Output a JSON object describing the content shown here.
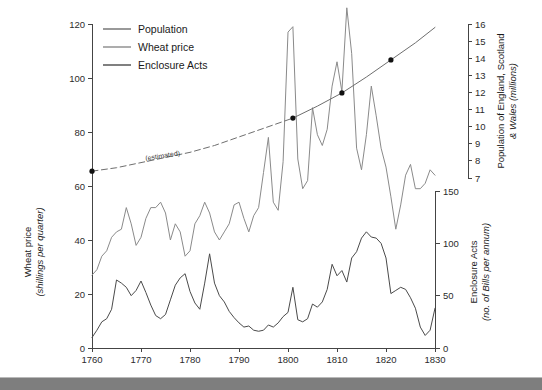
{
  "figure": {
    "background_color": "#ffffff",
    "bottom_bar_color": "#7e7e7e"
  },
  "legend": {
    "position": "top-left-inside",
    "entries": [
      {
        "label": "Population",
        "color": "#6e6e6e"
      },
      {
        "label": "Wheat price",
        "color": "#8a8a8a"
      },
      {
        "label": "Enclosure Acts",
        "color": "#4a4a4a"
      }
    ]
  },
  "annotations": [
    {
      "text": "(estimated)",
      "x_year": 1785,
      "y_value": 72
    }
  ],
  "axes": {
    "x": {
      "label": "",
      "ticks": [
        1760,
        1770,
        1780,
        1790,
        1800,
        1810,
        1820,
        1830
      ],
      "tick_labels": [
        "1760",
        "1770",
        "1780",
        "1790",
        "1800",
        "1810",
        "1820",
        "1830"
      ],
      "range": [
        1760,
        1830
      ]
    },
    "y_left": {
      "title_line1": "Wheat price",
      "title_line2": "(shillings per quarter)",
      "ticks": [
        0,
        20,
        40,
        60,
        80,
        100,
        120
      ],
      "tick_labels": [
        "0",
        "20",
        "40",
        "60",
        "80",
        "100",
        "120"
      ],
      "range": [
        0,
        120
      ]
    },
    "y_right_upper": {
      "title_line1": "Population of England, Scotland",
      "title_line2": "& Wales (millions)",
      "ticks": [
        7,
        8,
        9,
        10,
        11,
        12,
        13,
        14,
        15,
        16
      ],
      "tick_labels": [
        "7",
        "8",
        "9",
        "10",
        "11",
        "12",
        "13",
        "14",
        "15",
        "16"
      ],
      "range": [
        7,
        16
      ]
    },
    "y_right_lower": {
      "title_line1": "Enclosure Acts",
      "title_line2": "(no. of Bills per annum)",
      "ticks": [
        0,
        50,
        100,
        150
      ],
      "tick_labels": [
        "0",
        "50",
        "100",
        "150"
      ],
      "range": [
        0,
        150
      ]
    }
  },
  "chart_data": {
    "type": "line",
    "title": "",
    "xlabel": "",
    "ylabel": "Wheat price (shillings per quarter)",
    "xlim": [
      1760,
      1830
    ],
    "ylim": [
      0,
      120
    ],
    "grid": false,
    "legend_position": "upper left",
    "series": [
      {
        "name": "Population",
        "axis": "y_right_upper",
        "units": "millions",
        "color": "#6e6e6e",
        "style_segments": [
          {
            "from_year": 1760,
            "to_year": 1801,
            "dash": "dashed",
            "note": "(estimated)"
          },
          {
            "from_year": 1801,
            "to_year": 1830,
            "dash": "solid",
            "note": "census based"
          }
        ],
        "census_points": [
          {
            "x": 1760,
            "y": 7.4
          },
          {
            "x": 1801,
            "y": 10.5
          },
          {
            "x": 1811,
            "y": 11.97
          },
          {
            "x": 1821,
            "y": 13.9
          }
        ],
        "x": [
          1760,
          1765,
          1770,
          1775,
          1780,
          1785,
          1790,
          1795,
          1801,
          1806,
          1811,
          1816,
          1821,
          1826,
          1830
        ],
        "values": [
          7.4,
          7.6,
          7.9,
          8.2,
          8.5,
          8.9,
          9.4,
          9.9,
          10.5,
          11.2,
          11.97,
          12.9,
          13.9,
          14.9,
          15.8
        ]
      },
      {
        "name": "Wheat price",
        "axis": "y_left",
        "units": "shillings per quarter",
        "color": "#8a8a8a",
        "x": [
          1760,
          1761,
          1762,
          1763,
          1764,
          1765,
          1766,
          1767,
          1768,
          1769,
          1770,
          1771,
          1772,
          1773,
          1774,
          1775,
          1776,
          1777,
          1778,
          1779,
          1780,
          1781,
          1782,
          1783,
          1784,
          1785,
          1786,
          1787,
          1788,
          1789,
          1790,
          1791,
          1792,
          1793,
          1794,
          1795,
          1796,
          1797,
          1798,
          1799,
          1800,
          1801,
          1802,
          1803,
          1804,
          1805,
          1806,
          1807,
          1808,
          1809,
          1810,
          1811,
          1812,
          1813,
          1814,
          1815,
          1816,
          1817,
          1818,
          1819,
          1820,
          1821,
          1822,
          1823,
          1824,
          1825,
          1826,
          1827,
          1828,
          1829,
          1830
        ],
        "values": [
          27,
          29,
          34,
          36,
          41,
          43,
          44,
          52,
          46,
          38,
          41,
          48,
          52,
          52,
          54,
          50,
          40,
          46,
          43,
          34,
          36,
          46,
          49,
          54,
          50,
          43,
          40,
          43,
          46,
          53,
          54,
          48,
          43,
          49,
          52,
          65,
          78,
          54,
          51,
          69,
          117,
          119,
          70,
          59,
          62,
          89,
          79,
          75,
          81,
          97,
          106,
          95,
          126,
          109,
          74,
          66,
          79,
          97,
          86,
          74,
          67,
          56,
          44,
          53,
          64,
          68,
          59,
          59,
          61,
          66,
          64
        ]
      },
      {
        "name": "Enclosure Acts",
        "axis": "y_right_lower",
        "units": "no. of Bills per annum",
        "color": "#4a4a4a",
        "x": [
          1760,
          1761,
          1762,
          1763,
          1764,
          1765,
          1766,
          1767,
          1768,
          1769,
          1770,
          1771,
          1772,
          1773,
          1774,
          1775,
          1776,
          1777,
          1778,
          1779,
          1780,
          1781,
          1782,
          1783,
          1784,
          1785,
          1786,
          1787,
          1788,
          1789,
          1790,
          1791,
          1792,
          1793,
          1794,
          1795,
          1796,
          1797,
          1798,
          1799,
          1800,
          1801,
          1802,
          1803,
          1804,
          1805,
          1806,
          1807,
          1808,
          1809,
          1810,
          1811,
          1812,
          1813,
          1814,
          1815,
          1816,
          1817,
          1818,
          1819,
          1820,
          1821,
          1822,
          1823,
          1824,
          1825,
          1826,
          1827,
          1828,
          1829,
          1830
        ],
        "values": [
          10,
          17,
          25,
          28,
          37,
          65,
          62,
          58,
          50,
          55,
          64,
          53,
          41,
          31,
          28,
          32,
          46,
          60,
          67,
          71,
          54,
          43,
          37,
          62,
          90,
          62,
          50,
          44,
          35,
          29,
          24,
          20,
          21,
          17,
          16,
          17,
          22,
          20,
          24,
          30,
          34,
          58,
          27,
          25,
          28,
          42,
          39,
          44,
          56,
          80,
          69,
          74,
          63,
          86,
          92,
          105,
          111,
          106,
          105,
          100,
          86,
          52,
          55,
          58,
          56,
          48,
          38,
          20,
          12,
          17,
          38
        ]
      }
    ]
  }
}
